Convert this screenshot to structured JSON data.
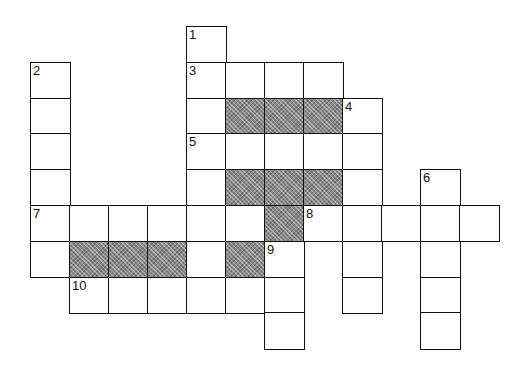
{
  "puzzle": {
    "type": "crossword",
    "columns": 13,
    "rows": 9,
    "colors": {
      "line": "#111111",
      "white": "#ffffff",
      "shade": "#8a8a8a"
    },
    "cells": [
      {
        "r": 0,
        "c": 4,
        "n": "1"
      },
      {
        "r": 1,
        "c": 0,
        "n": "2"
      },
      {
        "r": 1,
        "c": 4,
        "n": "3"
      },
      {
        "r": 1,
        "c": 5
      },
      {
        "r": 1,
        "c": 6
      },
      {
        "r": 1,
        "c": 7
      },
      {
        "r": 2,
        "c": 0
      },
      {
        "r": 2,
        "c": 4
      },
      {
        "r": 2,
        "c": 5,
        "s": true
      },
      {
        "r": 2,
        "c": 6,
        "s": true
      },
      {
        "r": 2,
        "c": 7,
        "s": true
      },
      {
        "r": 2,
        "c": 8,
        "n": "4"
      },
      {
        "r": 3,
        "c": 0
      },
      {
        "r": 3,
        "c": 4,
        "n": "5"
      },
      {
        "r": 3,
        "c": 5
      },
      {
        "r": 3,
        "c": 6
      },
      {
        "r": 3,
        "c": 7
      },
      {
        "r": 3,
        "c": 8
      },
      {
        "r": 4,
        "c": 0
      },
      {
        "r": 4,
        "c": 4
      },
      {
        "r": 4,
        "c": 5,
        "s": true
      },
      {
        "r": 4,
        "c": 6,
        "s": true
      },
      {
        "r": 4,
        "c": 7,
        "s": true
      },
      {
        "r": 4,
        "c": 8
      },
      {
        "r": 4,
        "c": 10,
        "n": "6"
      },
      {
        "r": 5,
        "c": 0,
        "n": "7"
      },
      {
        "r": 5,
        "c": 1
      },
      {
        "r": 5,
        "c": 2
      },
      {
        "r": 5,
        "c": 3
      },
      {
        "r": 5,
        "c": 4
      },
      {
        "r": 5,
        "c": 5
      },
      {
        "r": 5,
        "c": 6,
        "s": true
      },
      {
        "r": 5,
        "c": 7,
        "n": "8"
      },
      {
        "r": 5,
        "c": 8
      },
      {
        "r": 5,
        "c": 9
      },
      {
        "r": 5,
        "c": 10
      },
      {
        "r": 5,
        "c": 11
      },
      {
        "r": 6,
        "c": 0
      },
      {
        "r": 6,
        "c": 1,
        "s": true
      },
      {
        "r": 6,
        "c": 2,
        "s": true
      },
      {
        "r": 6,
        "c": 3,
        "s": true
      },
      {
        "r": 6,
        "c": 4
      },
      {
        "r": 6,
        "c": 5,
        "s": true
      },
      {
        "r": 6,
        "c": 6,
        "n": "9"
      },
      {
        "r": 6,
        "c": 8
      },
      {
        "r": 6,
        "c": 10
      },
      {
        "r": 7,
        "c": 1,
        "n": "10"
      },
      {
        "r": 7,
        "c": 2
      },
      {
        "r": 7,
        "c": 3
      },
      {
        "r": 7,
        "c": 4
      },
      {
        "r": 7,
        "c": 5
      },
      {
        "r": 7,
        "c": 6
      },
      {
        "r": 7,
        "c": 8
      },
      {
        "r": 7,
        "c": 10
      },
      {
        "r": 8,
        "c": 6
      },
      {
        "r": 8,
        "c": 10
      }
    ]
  }
}
